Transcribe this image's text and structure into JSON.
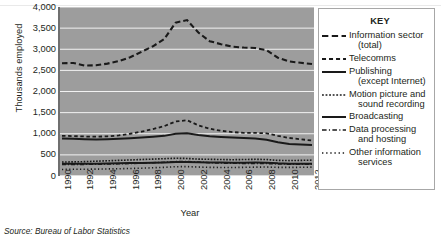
{
  "axes": {
    "ylabel": "Thousands employed",
    "xlabel": "Year",
    "yticks": [
      "4,000",
      "3,500",
      "3,000",
      "2,500",
      "2,000",
      "1,500",
      "1,000",
      "500",
      "0"
    ],
    "xticks": [
      "1990",
      "1992",
      "1994",
      "1996",
      "1998",
      "2000",
      "2002",
      "2004",
      "2006",
      "2008",
      "2010",
      "2012"
    ]
  },
  "legend": {
    "title": "KEY",
    "entries": [
      {
        "label": "Information sector",
        "cont": "(total)",
        "style": "long-dash"
      },
      {
        "label": "Telecomms",
        "cont": "",
        "style": "dash"
      },
      {
        "label": "Publishing",
        "cont": "(except Internet)",
        "style": "solid"
      },
      {
        "label": "Motion picture and",
        "cont": "sound recording",
        "style": "fine-dot"
      },
      {
        "label": "Broadcasting",
        "cont": "",
        "style": "solid"
      },
      {
        "label": "Data processing",
        "cont": "and hosting",
        "style": "dash-dot"
      },
      {
        "label": "Other information",
        "cont": "services",
        "style": "dot"
      }
    ]
  },
  "source": "Source: Bureau of Labor Statistics",
  "colors": {
    "plot_background": "#9d9d9d",
    "gridline": "#f2f2f2",
    "line": "#1a1a1a",
    "legend_background": "#ffffff",
    "text": "#231f20"
  },
  "chart_data": {
    "type": "line",
    "title": "",
    "xlabel": "Year",
    "ylabel": "Thousands employed",
    "xlim": [
      1990,
      2012
    ],
    "ylim": [
      0,
      4000
    ],
    "ytick_step": 500,
    "grid": true,
    "legend_position": "right",
    "x": [
      1990,
      1991,
      1992,
      1993,
      1994,
      1995,
      1996,
      1997,
      1998,
      1999,
      2000,
      2001,
      2002,
      2003,
      2004,
      2005,
      2006,
      2007,
      2008,
      2009,
      2010,
      2011,
      2012
    ],
    "series": [
      {
        "name": "Information sector (total)",
        "style": "long-dash",
        "values": [
          2670,
          2675,
          2615,
          2620,
          2660,
          2720,
          2810,
          2940,
          3070,
          3240,
          3630,
          3690,
          3395,
          3190,
          3120,
          3060,
          3040,
          3030,
          2980,
          2800,
          2710,
          2680,
          2650
        ]
      },
      {
        "name": "Telecomms",
        "style": "dash",
        "values": [
          950,
          945,
          935,
          930,
          940,
          960,
          1000,
          1050,
          1110,
          1180,
          1290,
          1320,
          1200,
          1120,
          1070,
          1040,
          1020,
          1020,
          1010,
          950,
          900,
          870,
          840
        ]
      },
      {
        "name": "Publishing (except Internet)",
        "style": "solid",
        "values": [
          890,
          880,
          870,
          865,
          870,
          880,
          895,
          910,
          930,
          950,
          1000,
          1010,
          970,
          940,
          925,
          910,
          900,
          890,
          860,
          800,
          760,
          745,
          735
        ]
      },
      {
        "name": "Motion picture and sound recording",
        "style": "fine-dot",
        "values": [
          330,
          335,
          340,
          350,
          360,
          370,
          380,
          390,
          400,
          410,
          420,
          415,
          400,
          395,
          390,
          385,
          390,
          395,
          390,
          370,
          365,
          370,
          375
        ]
      },
      {
        "name": "Broadcasting",
        "style": "solid",
        "values": [
          290,
          290,
          290,
          292,
          295,
          300,
          305,
          310,
          315,
          320,
          330,
          330,
          325,
          320,
          318,
          316,
          316,
          318,
          315,
          300,
          292,
          290,
          288
        ]
      },
      {
        "name": "Data processing and hosting",
        "style": "dash-dot",
        "values": [
          270,
          272,
          275,
          278,
          282,
          288,
          295,
          305,
          315,
          325,
          340,
          345,
          330,
          315,
          305,
          300,
          298,
          298,
          295,
          285,
          280,
          278,
          277
        ]
      },
      {
        "name": "Other information services",
        "style": "dot",
        "values": [
          155,
          158,
          160,
          163,
          167,
          172,
          178,
          185,
          195,
          205,
          220,
          222,
          212,
          205,
          202,
          202,
          205,
          210,
          212,
          205,
          203,
          206,
          210
        ]
      }
    ]
  }
}
